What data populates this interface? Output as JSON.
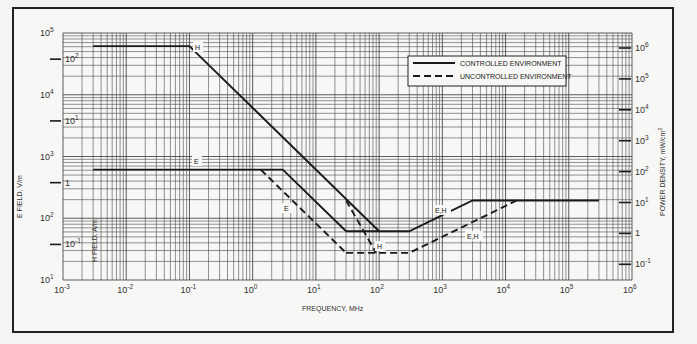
{
  "chart_data": {
    "type": "line",
    "title": "",
    "xlabel": "FREQUENCY, MHz",
    "ylabel": "E FIELD, V/m",
    "ylabel_inner": "H FIELD, A/m",
    "ylabel_right": "POWER DENSITY, mW/cm²",
    "xscale": "log",
    "yscale": "log",
    "xlim": [
      0.001,
      1000000
    ],
    "ylim": [
      10,
      100000
    ],
    "grid": true,
    "legend_position": "upper right",
    "x_ticks": [
      "10^-3",
      "10^-2",
      "10^-1",
      "10^0",
      "10^1",
      "10^2",
      "10^3",
      "10^4",
      "10^5",
      "10^6"
    ],
    "y_ticks": [
      "10^1",
      "10^2",
      "10^3",
      "10^4",
      "10^5"
    ],
    "h_field_ticks": [
      {
        "label": "10^2",
        "value_A_per_m": 100
      },
      {
        "label": "10^1",
        "value_A_per_m": 10
      },
      {
        "label": "1",
        "value_A_per_m": 1
      },
      {
        "label": "10^-1",
        "value_A_per_m": 0.1
      }
    ],
    "power_density_ticks": [
      {
        "label": "10^6"
      },
      {
        "label": "10^5"
      },
      {
        "label": "10^4"
      },
      {
        "label": "10^3"
      },
      {
        "label": "10^2"
      },
      {
        "label": "10^1"
      },
      {
        "label": "1"
      },
      {
        "label": "10^-1"
      }
    ],
    "series": [
      {
        "name": "CONTROLLED ENVIRONMENT - H",
        "style": "solid",
        "label": "H",
        "x": [
          0.003,
          0.1,
          100
        ],
        "y": [
          61400,
          61400,
          61.4
        ]
      },
      {
        "name": "CONTROLLED ENVIRONMENT - E",
        "style": "solid",
        "label": "E",
        "x": [
          0.003,
          3,
          30
        ],
        "y": [
          614,
          614,
          61.4
        ]
      },
      {
        "name": "CONTROLLED ENVIRONMENT - E,H",
        "style": "solid",
        "label": "E,H",
        "x": [
          30,
          300,
          3000,
          300000
        ],
        "y": [
          61.4,
          61.4,
          194,
          194
        ]
      },
      {
        "name": "UNCONTROLLED ENVIRONMENT - E",
        "style": "dashed",
        "label": "E",
        "x": [
          1.34,
          30
        ],
        "y": [
          614,
          27.5
        ]
      },
      {
        "name": "UNCONTROLLED ENVIRONMENT - H",
        "style": "dashed",
        "label": "H",
        "x": [
          30,
          90
        ],
        "y": [
          194,
          27.5
        ]
      },
      {
        "name": "UNCONTROLLED ENVIRONMENT - E,H",
        "style": "dashed",
        "label": "E,H",
        "x": [
          30,
          300,
          15000
        ],
        "y": [
          27.5,
          27.5,
          194
        ]
      }
    ],
    "legend": [
      {
        "label": "CONTROLLED ENVIRONMENT",
        "style": "solid"
      },
      {
        "label": "UNCONTROLLED ENVIRONMENT",
        "style": "dashed"
      }
    ]
  },
  "labels": {
    "x_axis": "FREQUENCY, MHz",
    "y_left": "E FIELD, V/m",
    "y_inner": "H FIELD, A/m",
    "y_right": "POWER DENSITY, mW/cm",
    "y_right_sup": "2",
    "legend_controlled": "CONTROLLED ENVIRONMENT",
    "legend_uncontrolled": "UNCONTROLLED ENVIRONMENT",
    "curve_H": "H",
    "curve_E": "E",
    "curve_EH": "E,H",
    "curve_E_dashed": "E",
    "curve_H_dashed": "H",
    "curve_EH_dashed": "E,H"
  },
  "colors": {
    "line": "#1a1a1a",
    "grid": "#4a4a4a",
    "background": "#f7f7f5"
  }
}
